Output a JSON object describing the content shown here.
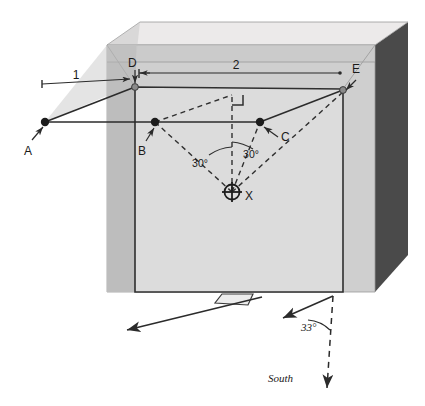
{
  "figure": {
    "kind": "survey-setout-isometric-diagram",
    "background_color": "#ffffff"
  },
  "block": {
    "top_face_color": "#e9e9e9",
    "front_face_color": "#d6d6d6",
    "left_face_color": "#b9b9b9",
    "right_face_color": "#4a4a4a",
    "edge_color": "#8c8c8c",
    "panel_face_color": "#dcdcdc",
    "panel_edge_color": "#3a3a3a"
  },
  "points": [
    {
      "id": "A",
      "label": "A",
      "style": "filled-dot",
      "x": 45,
      "y": 122
    },
    {
      "id": "B",
      "label": "B",
      "style": "filled-dot",
      "x": 155,
      "y": 122
    },
    {
      "id": "C",
      "label": "C",
      "style": "filled-dot",
      "x": 260,
      "y": 122
    },
    {
      "id": "D",
      "label": "D",
      "style": "open-dot",
      "x": 135,
      "y": 86
    },
    {
      "id": "E",
      "label": "E",
      "style": "open-dot",
      "x": 343,
      "y": 90
    },
    {
      "id": "X",
      "label": "X",
      "style": "crosshair",
      "x": 232,
      "y": 192
    }
  ],
  "dimensions": [
    {
      "id": "dim-1",
      "label": "1",
      "label_x": 76,
      "label_y": 78,
      "from_x": 42,
      "from_y": 84,
      "to_x": 131,
      "to_y": 79
    },
    {
      "id": "dim-2",
      "label": "2",
      "label_x": 236,
      "label_y": 66,
      "from_x": 139,
      "from_y": 73,
      "to_x": 340,
      "to_y": 73
    }
  ],
  "angles": [
    {
      "id": "angle-left",
      "label": "30°",
      "label_x": 200,
      "label_y": 164
    },
    {
      "id": "angle-right",
      "label": "30°",
      "label_x": 249,
      "label_y": 156
    },
    {
      "id": "angle-south",
      "label": "33°",
      "label_x": 309,
      "label_y": 327
    }
  ],
  "annotations": [
    {
      "id": "south-label",
      "label": "South",
      "x": 291,
      "y": 379
    }
  ],
  "markers": {
    "right_angle": {
      "id": "right-angle-marker",
      "x": 232,
      "y": 95
    }
  },
  "arrows": {
    "bearing_arrow": {
      "id": "bearing-arrow-left",
      "from_x": 262,
      "from_y": 297,
      "to_x": 125,
      "to_y": 331
    },
    "south_arrow": {
      "id": "south-arrow",
      "from_x": 333,
      "from_y": 297,
      "to_x": 327,
      "to_y": 391,
      "dashed": true
    },
    "angle_arrow": {
      "id": "angle-33-arrow",
      "from_x": 333,
      "from_y": 297,
      "to_x": 281,
      "to_y": 319
    }
  }
}
